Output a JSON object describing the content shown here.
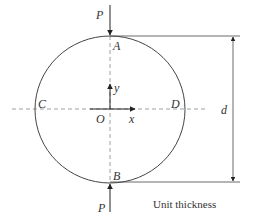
{
  "figure": {
    "type": "Brazilian disc test specimen under diametral compression",
    "colors": {
      "stroke": "#444444",
      "dashed": "#888888",
      "text": "#333333",
      "background": "#ffffff"
    },
    "labels": {
      "load_top": "P",
      "load_bottom": "P",
      "point_top": "A",
      "point_bottom": "B",
      "point_left": "C",
      "point_right": "D",
      "origin": "O",
      "x_axis": "x",
      "y_axis": "y",
      "diameter": "d",
      "caption": "Unit thickness"
    },
    "icons": {
      "load_arrow_top": "arrow-down-icon",
      "load_arrow_bottom": "arrow-up-icon",
      "x_axis_arrow": "arrow-right-icon",
      "y_axis_arrow": "arrow-up-icon",
      "dimension_arrows": "double-arrow-vertical-icon"
    }
  }
}
